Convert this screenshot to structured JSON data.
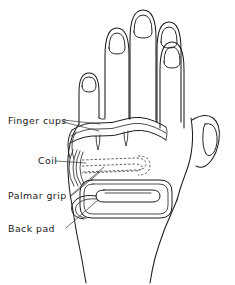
{
  "diagram": {
    "background_color": "#ffffff",
    "line_color": "#1c1c1c",
    "labels": [
      {
        "id": "finger-cups",
        "text": "Finger cups",
        "x": 8,
        "y": 124
      },
      {
        "id": "coil",
        "text": "Coil",
        "x": 38,
        "y": 164
      },
      {
        "id": "palmar-grip",
        "text": "Palmar grip",
        "x": 8,
        "y": 199
      },
      {
        "id": "back-pad",
        "text": "Back pad",
        "x": 8,
        "y": 232
      }
    ],
    "parts": [
      {
        "id": "finger-cups",
        "name": "Finger cups",
        "style": "solid"
      },
      {
        "id": "coil",
        "name": "Coil",
        "style": "dashed"
      },
      {
        "id": "palmar-grip",
        "name": "Palmar grip",
        "style": "solid"
      },
      {
        "id": "back-pad",
        "name": "Back pad",
        "style": "solid"
      }
    ],
    "anatomy": {
      "fingers": 4,
      "thumb": 1,
      "nails_visible": 5
    }
  }
}
